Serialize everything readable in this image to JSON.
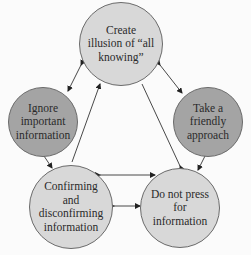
{
  "diagram": {
    "nodes": [
      {
        "id": "top",
        "label": "Create\nillusion of “all\nknowing”",
        "fill": "#d8d8d8"
      },
      {
        "id": "left",
        "label": "Ignore\nimportant\ninformation",
        "fill": "#a4a4a4"
      },
      {
        "id": "right",
        "label": "Take a\nfriendly\napproach",
        "fill": "#a4a4a4"
      },
      {
        "id": "bottom_left",
        "label": "Confirming\nand\ndisconfirming\ninformation",
        "fill": "#d8d8d8"
      },
      {
        "id": "bottom_right",
        "label": "Do not press\nfor\ninformation",
        "fill": "#d8d8d8"
      }
    ],
    "edges": [
      {
        "from": "top",
        "to": "left",
        "type": "bidirectional"
      },
      {
        "from": "top",
        "to": "right",
        "type": "bidirectional"
      },
      {
        "from": "bottom_left",
        "to": "top",
        "type": "directed"
      },
      {
        "from": "bottom_right",
        "to": "top",
        "type": "directed"
      },
      {
        "from": "left",
        "to": "bottom_left",
        "type": "bidirectional"
      },
      {
        "from": "right",
        "to": "bottom_right",
        "type": "bidirectional"
      },
      {
        "from": "bottom_left",
        "to": "bottom_right",
        "type": "bidirectional",
        "position": "upper"
      },
      {
        "from": "bottom_left",
        "to": "bottom_right",
        "type": "bidirectional",
        "position": "lower"
      }
    ]
  }
}
